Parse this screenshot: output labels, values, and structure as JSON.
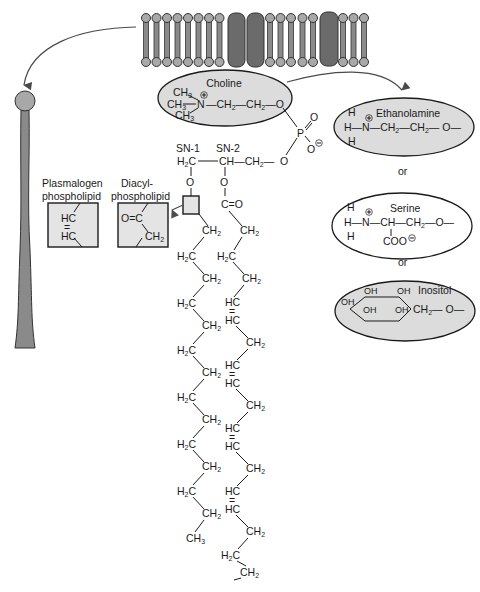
{
  "diagram": {
    "type": "phospholipid-structure",
    "membrane": {
      "lipid_count_left": 8,
      "proteins": 3,
      "lipid_count_middle": 5,
      "lipid_count_right": 3
    },
    "headgroups": {
      "choline": {
        "label": "Choline",
        "methyl_1": "CH3",
        "methyl_2": "CH3",
        "methyl_3": "CH3",
        "nitrogen": "N",
        "charge": "+",
        "chain": "—CH2—CH2—O"
      },
      "ethanolamine": {
        "label": "Ethanolamine",
        "formula": "H3N+—CH2—CH2—O—"
      },
      "serine": {
        "label": "Serine",
        "formula": "H3N+—CH(COO−)—CH2—O—",
        "carboxylate": "COO"
      },
      "inositol": {
        "label": "Inositol",
        "hydroxyls": [
          "OH",
          "OH",
          "OH",
          "OH",
          "OH"
        ],
        "tail": "CH2—O—"
      },
      "or_1": "or",
      "or_2": "or"
    },
    "phosphate": {
      "atom": "P",
      "oxygens": [
        "O",
        "O",
        "O"
      ],
      "charge": "−"
    },
    "glycerol": {
      "sn1_label": "SN-1",
      "sn2_label": "SN-2",
      "c1": "H2C",
      "c2": "CH",
      "c3": "CH2",
      "o_link": "O"
    },
    "linkage_types": {
      "plasmalogen": {
        "label_line1": "Plasmalogen",
        "label_line2": "phospholipid",
        "formula_top": "HC",
        "double_bond": "=",
        "formula_bottom": "HC"
      },
      "diacyl": {
        "label_line1": "Diacyl-",
        "label_line2": "phospholipid",
        "carbonyl": "O=C",
        "methylene": "CH2"
      }
    },
    "sn2_carbonyl": "C=O",
    "chains": {
      "sn1": [
        "CH2",
        "H2C",
        "CH2",
        "H2C",
        "CH2",
        "H2C",
        "CH2",
        "H2C",
        "CH2",
        "H2C",
        "CH2",
        "H2C",
        "CH2",
        "H2C",
        "CH2",
        "H2C",
        "CH3"
      ],
      "sn2": [
        "CH2",
        "H2C",
        "CH2",
        "HC",
        "HC",
        "CH2",
        "HC",
        "HC",
        "CH2",
        "HC",
        "HC",
        "CH2",
        "HC",
        "HC",
        "CH2",
        "H2C",
        "CH2",
        "H2C",
        "CH3"
      ]
    }
  }
}
